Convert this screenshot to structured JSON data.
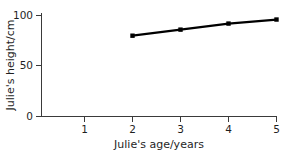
{
  "chart_data": {
    "type": "line",
    "title": "",
    "xlabel": "Julie's age/years",
    "ylabel": "Julie's height/cm",
    "x": [
      2,
      3,
      4,
      5
    ],
    "values": [
      80,
      86,
      92,
      96
    ],
    "series": [
      {
        "name": "Julie's height",
        "x": [
          2,
          3,
          4,
          5
        ],
        "values": [
          80,
          86,
          92,
          96
        ]
      }
    ],
    "xlim": [
      0,
      5.2
    ],
    "ylim": [
      0,
      102
    ],
    "xticks": [
      1,
      2,
      3,
      4,
      5
    ],
    "xtick_labels": [
      "1",
      "2",
      "3",
      "4",
      "5"
    ],
    "yticks": [
      0,
      50,
      100
    ],
    "ytick_labels": [
      "0",
      "50",
      "100"
    ],
    "grid": false,
    "legend": false,
    "legend_position": "none",
    "marker": "square",
    "line_color": "#000000",
    "marker_color": "#000000",
    "axis_color": "#3a3a3a",
    "background_color": "#ffffff"
  },
  "axes": {
    "x_title": "Julie's age/years",
    "y_title": "Julie's height/cm"
  },
  "ytick_labels": {
    "t0": "0",
    "t1": "50",
    "t2": "100"
  },
  "xtick_labels": {
    "t1": "1",
    "t2": "2",
    "t3": "3",
    "t4": "4",
    "t5": "5"
  }
}
